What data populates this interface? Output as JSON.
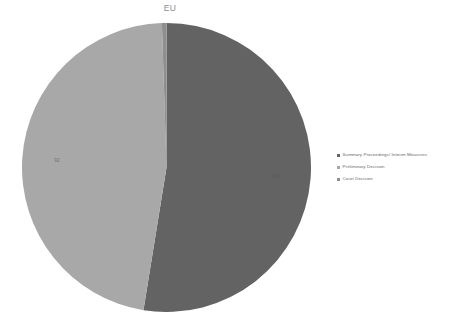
{
  "chart_data": {
    "type": "pie",
    "title": "EU",
    "xlabel": "",
    "ylabel": "",
    "legend_position": "right",
    "grid": false,
    "categories": [
      "Summary Proceedings/ Interim Measures",
      "Preliminary Decision",
      "Court Decision"
    ],
    "values": [
      103,
      92,
      1
    ],
    "data_labels": [
      "103",
      "92",
      ""
    ],
    "colors": [
      "#636363",
      "#a8a8a8",
      "#8f8f8f"
    ],
    "start_angle_deg": 0,
    "direction": "clockwise"
  },
  "chart": {
    "title": "EU",
    "slices": [
      {
        "name": "Summary Proceedings/ Interim Measures",
        "label": "103",
        "color": "#636363"
      },
      {
        "name": "Preliminary Decision",
        "label": "92",
        "color": "#a8a8a8"
      },
      {
        "name": "Court Decision",
        "label": "",
        "color": "#8f8f8f"
      }
    ]
  },
  "legend": {
    "items": [
      {
        "label": "Summary Proceedings/ Interim Measures",
        "color": "#636363"
      },
      {
        "label": "Preliminary Decision",
        "color": "#a8a8a8"
      },
      {
        "label": "Court Decision",
        "color": "#8f8f8f"
      }
    ]
  }
}
